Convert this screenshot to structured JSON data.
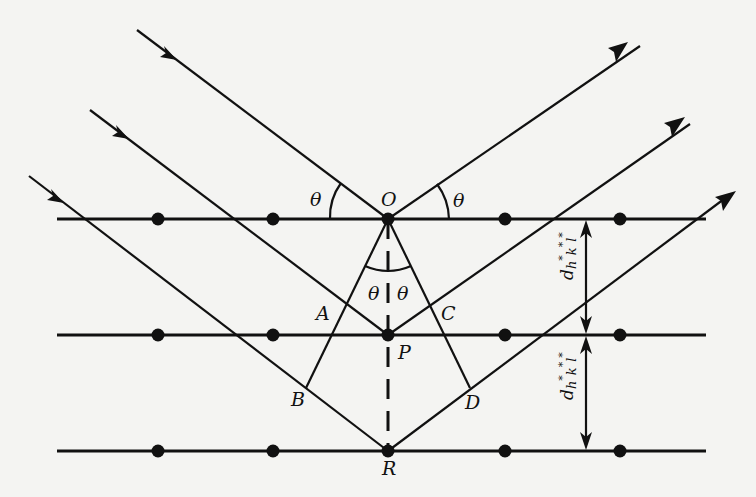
{
  "figure": {
    "type": "bragg-reflection-diagram",
    "colors": {
      "background": "#f4f4f2",
      "ink": "#111111"
    },
    "points": {
      "O": "O",
      "P": "P",
      "R": "R",
      "A": "A",
      "B": "B",
      "C": "C",
      "D": "D"
    },
    "angles": {
      "incident_left": "θ",
      "reflected_right": "θ",
      "inner_left": "θ",
      "inner_right": "θ"
    },
    "spacing_labels": {
      "upper": {
        "base": "d",
        "sub": "h",
        "sup1": "*",
        "k": "k",
        "sup2": "*",
        "l": "l",
        "sup3": "*"
      },
      "lower": {
        "base": "d",
        "sub": "h",
        "sup1": "*",
        "k": "k",
        "sup2": "*",
        "l": "l",
        "sup3": "*"
      }
    },
    "planes": [
      {
        "name": "top-plane",
        "y": 219,
        "dots_x": [
          158,
          273,
          388,
          505,
          620
        ]
      },
      {
        "name": "middle-plane",
        "y": 335,
        "dots_x": [
          158,
          273,
          388,
          505,
          620
        ]
      },
      {
        "name": "bottom-plane",
        "y": 451,
        "dots_x": [
          158,
          273,
          388,
          505,
          620
        ]
      }
    ],
    "ray_count": {
      "incident": 3,
      "reflected": 3
    }
  }
}
